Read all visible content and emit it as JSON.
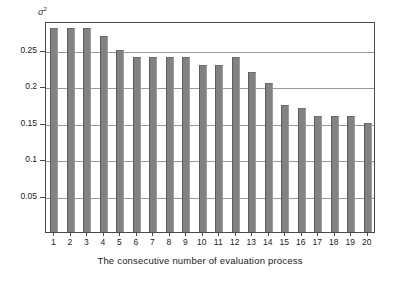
{
  "chart_data": {
    "type": "bar",
    "title": "",
    "subtitle": "",
    "xlabel": "The consecutive number of evaluation process",
    "ylabel": "σ²",
    "ylabel_display": "σ",
    "ylabel_sup": "2",
    "categories": [
      "1",
      "2",
      "3",
      "4",
      "5",
      "6",
      "7",
      "8",
      "9",
      "10",
      "11",
      "12",
      "13",
      "14",
      "15",
      "16",
      "17",
      "18",
      "19",
      "20"
    ],
    "values": [
      0.28,
      0.28,
      0.28,
      0.27,
      0.25,
      0.24,
      0.24,
      0.24,
      0.24,
      0.23,
      0.23,
      0.24,
      0.22,
      0.205,
      0.175,
      0.17,
      0.16,
      0.16,
      0.16,
      0.15
    ],
    "series": [
      {
        "name": "variance",
        "values": [
          0.28,
          0.28,
          0.28,
          0.27,
          0.25,
          0.24,
          0.24,
          0.24,
          0.24,
          0.23,
          0.23,
          0.24,
          0.22,
          0.205,
          0.175,
          0.17,
          0.16,
          0.16,
          0.16,
          0.15
        ]
      }
    ],
    "ylim": [
      0,
      0.29
    ],
    "xlim": [
      0.5,
      20.5
    ],
    "yticks": [
      0.05,
      0.1,
      0.15,
      0.2,
      0.25
    ],
    "ytick_labels": [
      "0.05",
      "0.1",
      "0.15",
      "0.2",
      "0.25"
    ],
    "grid": true,
    "grid_axis": "y",
    "legend": false,
    "legend_position": "none",
    "bar_color": "#828282",
    "bar_edge_color": "#5c5c5c",
    "grid_color": "#999999",
    "frame_color": "#4a4a4a",
    "background": "#ffffff",
    "text_color": "#1a1a1a",
    "annotations": []
  }
}
